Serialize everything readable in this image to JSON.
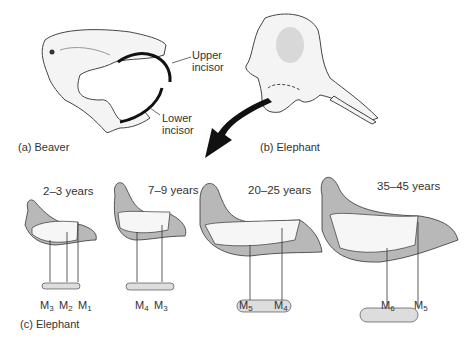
{
  "panel_a": {
    "caption": "(a) Beaver",
    "labels": {
      "upper": [
        "Upper",
        "incisor"
      ],
      "lower": [
        "Lower",
        "incisor"
      ]
    }
  },
  "panel_b": {
    "caption": "(b) Elephant"
  },
  "panel_c": {
    "caption": "(c) Elephant",
    "stages": [
      {
        "age": "2–3 years",
        "molars": [
          {
            "m": "M",
            "n": "3"
          },
          {
            "m": "M",
            "n": "2"
          },
          {
            "m": "M",
            "n": "1"
          }
        ]
      },
      {
        "age": "7–9 years",
        "molars": [
          {
            "m": "M",
            "n": "4"
          },
          {
            "m": "M",
            "n": "3"
          }
        ]
      },
      {
        "age": "20–25 years",
        "molars": [
          {
            "m": "M",
            "n": "5"
          },
          {
            "m": "M",
            "n": "4"
          }
        ]
      },
      {
        "age": "35–45 years",
        "molars": [
          {
            "m": "M",
            "n": "6"
          },
          {
            "m": "M",
            "n": "5"
          }
        ]
      }
    ]
  },
  "colors": {
    "jaw_fill": "#b8b8b8",
    "line": "#222222",
    "arrow": "#111111"
  }
}
